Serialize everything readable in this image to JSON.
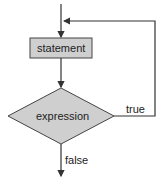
{
  "diagram": {
    "type": "flowchart",
    "nodes": [
      {
        "id": "statement",
        "shape": "rectangle",
        "label": "statement"
      },
      {
        "id": "expression",
        "shape": "diamond",
        "label": "expression"
      }
    ],
    "edges": [
      {
        "from": "entry",
        "to": "statement",
        "label": ""
      },
      {
        "from": "statement",
        "to": "expression",
        "label": ""
      },
      {
        "from": "expression",
        "to": "statement",
        "label": "true"
      },
      {
        "from": "expression",
        "to": "exit",
        "label": "false"
      }
    ],
    "colors": {
      "node_fill": "#cfcfcf",
      "stroke": "#333333"
    }
  }
}
